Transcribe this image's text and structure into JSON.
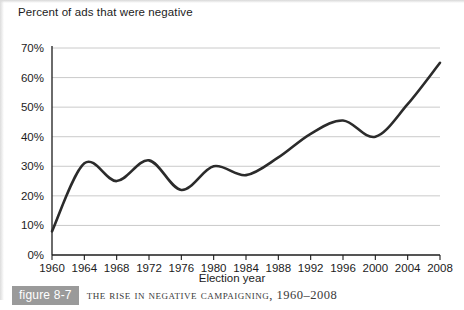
{
  "figure": {
    "badge_label": "figure 8-7",
    "caption": "The Rise in Negative Campaigning, 1960–2008"
  },
  "chart_data": {
    "type": "line",
    "title": "",
    "xlabel": "Election year",
    "ylabel": "Percent of ads that were negative",
    "x": [
      1960,
      1964,
      1968,
      1972,
      1976,
      1980,
      1984,
      1988,
      1992,
      1996,
      2000,
      2004,
      2008
    ],
    "categories": [
      "1960",
      "1964",
      "1968",
      "1972",
      "1976",
      "1980",
      "1984",
      "1988",
      "1992",
      "1996",
      "2000",
      "2004",
      "2008"
    ],
    "values": [
      8,
      31,
      25,
      32,
      22,
      30,
      27,
      33,
      41,
      45.5,
      40,
      51,
      65
    ],
    "series": [
      {
        "name": "Percent of ads that were negative",
        "values": [
          8,
          31,
          25,
          32,
          22,
          30,
          27,
          33,
          41,
          45.5,
          40,
          51,
          65
        ]
      }
    ],
    "xlim": [
      1960,
      2008
    ],
    "ylim": [
      0,
      70
    ],
    "y_ticks": [
      0,
      10,
      20,
      30,
      40,
      50,
      60,
      70
    ],
    "y_tick_labels": [
      "0%",
      "10%",
      "20%",
      "30%",
      "40%",
      "50%",
      "60%",
      "70%"
    ],
    "x_ticks": [
      1960,
      1964,
      1968,
      1972,
      1976,
      1980,
      1984,
      1988,
      1992,
      1996,
      2000,
      2004,
      2008
    ],
    "grid": "horizontal",
    "legend": "none",
    "line_color": "#2b2b2b",
    "grid_color": "#c4c4c4",
    "axis_color": "#1c1c1c",
    "smoothing": "spline"
  }
}
